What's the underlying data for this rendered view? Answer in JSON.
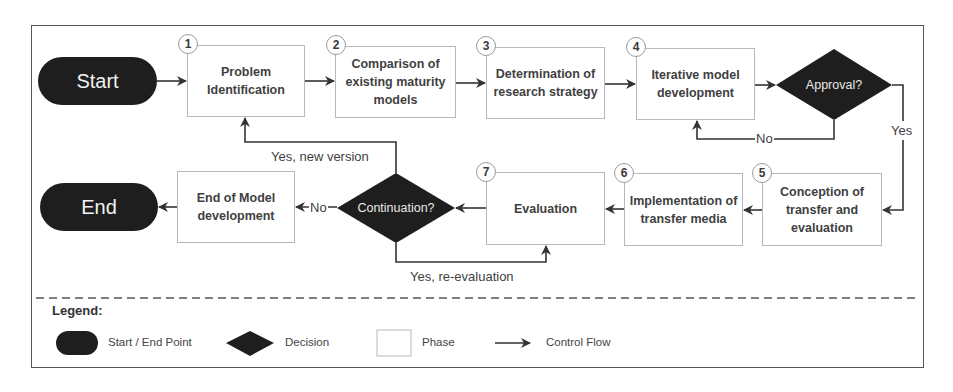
{
  "diagram": {
    "start": {
      "label": "Start"
    },
    "end": {
      "label": "End"
    },
    "phases": [
      {
        "number": "1",
        "label": "Problem Identification"
      },
      {
        "number": "2",
        "label": "Comparison of existing maturity models"
      },
      {
        "number": "3",
        "label": "Determination of research strategy"
      },
      {
        "number": "4",
        "label": "Iterative model development"
      },
      {
        "number": "5",
        "label": "Conception of transfer and evaluation"
      },
      {
        "number": "6",
        "label": "Implementation of transfer media"
      },
      {
        "number": "7",
        "label": "Evaluation"
      }
    ],
    "end_phase": {
      "label": "End of Model development"
    },
    "decisions": {
      "approval": {
        "label": "Approval?",
        "yes": "Yes",
        "no": "No"
      },
      "continuation": {
        "label": "Continuation?",
        "no": "No",
        "yes_new": "Yes, new version",
        "yes_re": "Yes, re-evaluation"
      }
    },
    "colors": {
      "terminal": "#1e1e1e",
      "decision": "#1e1e1e",
      "phase_border": "#b8b8b8",
      "line": "#333333"
    }
  },
  "legend": {
    "title": "Legend:",
    "items": [
      {
        "shape": "pill",
        "label": "Start / End Point"
      },
      {
        "shape": "diamond",
        "label": "Decision"
      },
      {
        "shape": "box",
        "label": "Phase"
      },
      {
        "shape": "arrow",
        "label": "Control Flow"
      }
    ]
  }
}
